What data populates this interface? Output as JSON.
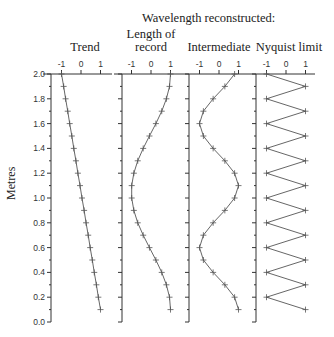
{
  "chart_data": {
    "type": "line",
    "title": "Wavelength reconstructed:",
    "ylabel": "Metres",
    "ylim": [
      0.0,
      2.0
    ],
    "yticks": [
      "0.0",
      "0.2",
      "0.4",
      "0.6",
      "0.8",
      "1.0",
      "1.2",
      "1.4",
      "1.6",
      "1.8",
      "2.0"
    ],
    "xticks": [
      "-1",
      "0",
      "1"
    ],
    "xlim": [
      -1.5,
      1.5
    ],
    "y": [
      0.1,
      0.2,
      0.3,
      0.4,
      0.5,
      0.6,
      0.7,
      0.8,
      0.9,
      1.0,
      1.1,
      1.2,
      1.3,
      1.4,
      1.5,
      1.6,
      1.7,
      1.8,
      1.9,
      2.0
    ],
    "series": [
      {
        "name": "Trend",
        "title_lines": [
          "Trend"
        ],
        "values": [
          1.0,
          0.89,
          0.79,
          0.68,
          0.58,
          0.47,
          0.37,
          0.26,
          0.16,
          0.05,
          -0.05,
          -0.16,
          -0.26,
          -0.37,
          -0.47,
          -0.58,
          -0.68,
          -0.79,
          -0.89,
          -1.0
        ]
      },
      {
        "name": "Length of record",
        "title_lines": [
          "Length of",
          "record"
        ],
        "values": [
          1.0,
          0.95,
          0.79,
          0.55,
          0.25,
          -0.08,
          -0.4,
          -0.68,
          -0.88,
          -0.99,
          -0.99,
          -0.88,
          -0.68,
          -0.4,
          -0.08,
          0.25,
          0.55,
          0.79,
          0.95,
          1.0
        ]
      },
      {
        "name": "Intermediate",
        "title_lines": [
          "Intermediate"
        ],
        "values": [
          1.0,
          0.8,
          0.3,
          -0.3,
          -0.8,
          -1.0,
          -0.8,
          -0.3,
          0.3,
          0.8,
          1.0,
          0.8,
          0.3,
          -0.3,
          -0.8,
          -1.0,
          -0.8,
          -0.3,
          0.3,
          0.8
        ]
      },
      {
        "name": "Nyquist limit",
        "title_lines": [
          "Nyquist limit"
        ],
        "values": [
          1,
          -1,
          1,
          -1,
          1,
          -1,
          1,
          -1,
          1,
          -1,
          1,
          -1,
          1,
          -1,
          1,
          -1,
          1,
          -1,
          1,
          -1
        ]
      }
    ],
    "grid": false,
    "legend": "none",
    "colors": {
      "line": "#555555",
      "axis": "#333333",
      "text": "#222222"
    }
  }
}
